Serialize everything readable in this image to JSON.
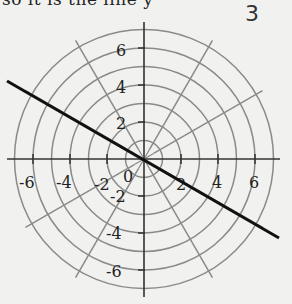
{
  "header": {
    "clipped_text": "so it is the line y",
    "problem_number": "3"
  },
  "chart_data": {
    "type": "polar-grid",
    "title": "",
    "circles": {
      "radii": [
        1,
        2,
        3,
        4,
        5,
        6,
        7
      ]
    },
    "radial_lines_deg": [
      0,
      30,
      60,
      90,
      120,
      150,
      180,
      210,
      240,
      270,
      300,
      330
    ],
    "x_ticks": [
      -6,
      -4,
      -2,
      0,
      2,
      4,
      6
    ],
    "y_ticks": [
      -6,
      -4,
      -2,
      2,
      4,
      6
    ],
    "x_tick_labels": [
      "-6",
      "-4",
      "-2",
      "0",
      "2",
      "4",
      "6"
    ],
    "y_tick_labels": [
      "6",
      "4",
      "2",
      "-2",
      "-4",
      "-6"
    ],
    "xlim": [
      -7.4,
      7.4
    ],
    "ylim": [
      -7.4,
      7.4
    ],
    "line": {
      "description": "line through origin at angle 150 degrees (theta = 5pi/6)",
      "slope": -0.577,
      "from": [
        -7.4,
        4.3
      ],
      "to": [
        7.3,
        -4.2
      ],
      "color": "#111111"
    },
    "grid_color": "#8a8a8a",
    "axis_color": "#333333"
  },
  "labels": {
    "x": {
      "n6": "-6",
      "n4": "-4",
      "n2": "-2",
      "zero": "0",
      "p2": "2",
      "p4": "4",
      "p6": "6"
    },
    "y": {
      "p6": "6",
      "p4": "4",
      "p2": "2",
      "n2": "-2",
      "n4": "-4",
      "n6": "-6"
    }
  }
}
